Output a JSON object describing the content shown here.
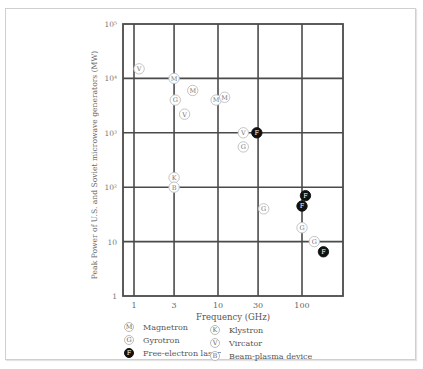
{
  "chart_data": {
    "type": "scatter",
    "title": "",
    "xlabel": "Frequency (GHz)",
    "ylabel": "Peak Power of U.S. and Soviet microwave generators (MW)",
    "xscale": "log",
    "yscale": "log",
    "xlim": [
      0.75,
      300
    ],
    "ylim": [
      1,
      100000
    ],
    "x_ticks": [
      "1",
      "3",
      "10",
      "30",
      "100"
    ],
    "y_ticks": [
      "1",
      "10",
      "10²",
      "10³",
      "10⁴",
      "10⁵"
    ],
    "grid": true,
    "legend_position": "bottom",
    "series": [
      {
        "name": "Magnetron",
        "symbol": "M",
        "filled": false,
        "points": [
          {
            "x": 3,
            "y": 10000
          },
          {
            "x": 5,
            "y": 6000
          },
          {
            "x": 9.5,
            "y": 4000
          },
          {
            "x": 12,
            "y": 4500
          }
        ]
      },
      {
        "name": "Gyrotron",
        "symbol": "G",
        "filled": false,
        "points": [
          {
            "x": 3.1,
            "y": 4000
          },
          {
            "x": 20,
            "y": 550
          },
          {
            "x": 35,
            "y": 40
          },
          {
            "x": 100,
            "y": 18
          },
          {
            "x": 140,
            "y": 10
          }
        ]
      },
      {
        "name": "Free-electron laser",
        "symbol": "F",
        "filled": true,
        "points": [
          {
            "x": 29,
            "y": 1000
          },
          {
            "x": 110,
            "y": 70
          },
          {
            "x": 100,
            "y": 45
          },
          {
            "x": 180,
            "y": 6.5
          }
        ]
      },
      {
        "name": "Klystron",
        "symbol": "K",
        "filled": false,
        "points": [
          {
            "x": 3,
            "y": 150
          }
        ]
      },
      {
        "name": "Vircator",
        "symbol": "V",
        "filled": false,
        "points": [
          {
            "x": 1.15,
            "y": 15000
          },
          {
            "x": 4,
            "y": 2200
          },
          {
            "x": 20,
            "y": 1000
          }
        ]
      },
      {
        "name": "Beam-plasma device",
        "symbol": "B",
        "filled": false,
        "points": [
          {
            "x": 3,
            "y": 100
          }
        ]
      }
    ]
  },
  "legend": {
    "items": [
      {
        "symbol": "M",
        "label": "Magnetron",
        "filled": false
      },
      {
        "symbol": "G",
        "label": "Gyrotron",
        "filled": false
      },
      {
        "symbol": "F",
        "label": "Free-electron laser",
        "filled": true
      },
      {
        "symbol": "K",
        "label": "Klystron",
        "filled": false
      },
      {
        "symbol": "V",
        "label": "Vircator",
        "filled": false
      },
      {
        "symbol": "B",
        "label": "Beam-plasma device",
        "filled": false
      }
    ]
  }
}
